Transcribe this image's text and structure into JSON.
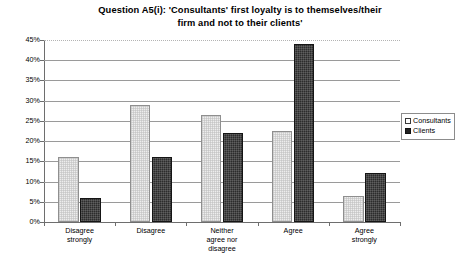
{
  "chart_data": {
    "type": "bar",
    "title": "Question A5(i): 'Consultants' first loyalty is to themselves/their firm and not to their clients'",
    "title_line1": "Question A5(i): 'Consultants' first loyalty is to themselves/their",
    "title_line2": "firm and not to their clients'",
    "xlabel": "",
    "ylabel": "",
    "ylim": [
      0,
      45
    ],
    "grid": true,
    "legend_position": "right",
    "categories": [
      "Disagree strongly",
      "Disagree",
      "Neither agree nor disagree",
      "Agree",
      "Agree strongly"
    ],
    "category_lines": [
      [
        "Disagree",
        "strongly"
      ],
      [
        "Disagree"
      ],
      [
        "Neither",
        "agree nor",
        "disagree"
      ],
      [
        "Agree"
      ],
      [
        "Agree",
        "strongly"
      ]
    ],
    "series": [
      {
        "name": "Consultants",
        "color": "#ededed",
        "values": [
          16,
          29,
          26.5,
          22.5,
          6.5
        ]
      },
      {
        "name": "Clients",
        "color": "#2c2c2c",
        "values": [
          6,
          16,
          22,
          44,
          12
        ]
      }
    ],
    "y_ticks": [
      0,
      5,
      10,
      15,
      20,
      25,
      30,
      35,
      40,
      45
    ],
    "y_tick_labels": [
      "0%",
      "5%",
      "10%",
      "15%",
      "20%",
      "25%",
      "30%",
      "35%",
      "40%",
      "45%"
    ]
  },
  "legend": {
    "items": [
      {
        "label": "Consultants"
      },
      {
        "label": "Clients"
      }
    ]
  }
}
